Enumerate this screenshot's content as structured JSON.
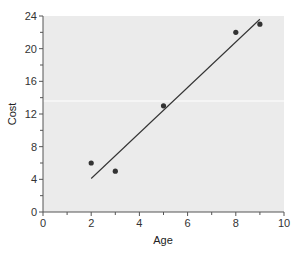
{
  "chart_data": {
    "type": "scatter",
    "title": "",
    "xlabel": "Age",
    "ylabel": "Cost",
    "xlim": [
      0,
      10
    ],
    "ylim": [
      0,
      24
    ],
    "xticks": [
      0,
      2,
      4,
      6,
      8,
      10
    ],
    "yticks": [
      0,
      4,
      8,
      12,
      16,
      20,
      24
    ],
    "grid": false,
    "legend": null,
    "series": [
      {
        "name": "observations",
        "type": "scatter",
        "x": [
          2,
          3,
          5,
          8,
          9
        ],
        "y": [
          6,
          5,
          13,
          22,
          23
        ]
      },
      {
        "name": "regression line",
        "type": "line",
        "x": [
          2,
          9
        ],
        "y": [
          4.1,
          23.6
        ]
      }
    ]
  },
  "colors": {
    "plot_background": "#ebebeb",
    "points": "#333333",
    "line": "#333333",
    "axis": "#555555"
  }
}
